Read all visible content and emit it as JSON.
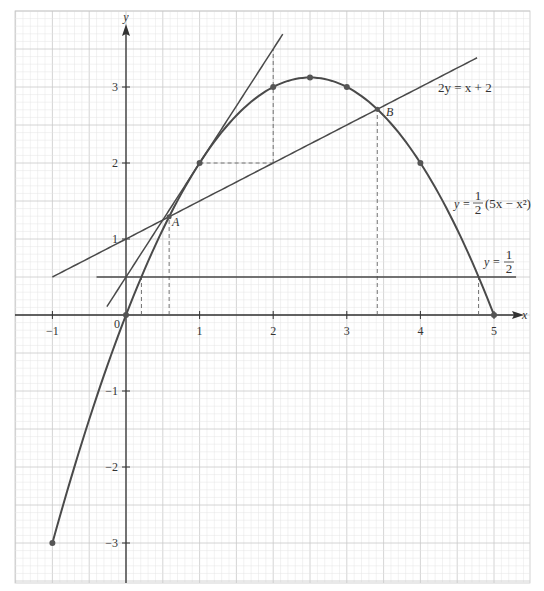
{
  "chart_data": {
    "type": "line",
    "title": "",
    "xlabel": "x",
    "ylabel": "y",
    "xlim": [
      -1,
      5
    ],
    "ylim": [
      -3.5,
      3.8
    ],
    "grid": true,
    "x_ticks": [
      -1,
      1,
      2,
      3,
      4,
      5
    ],
    "y_ticks": [
      -3,
      -2,
      -1,
      1,
      2,
      3
    ],
    "origin_label": "0",
    "series": [
      {
        "name": "parabola",
        "label": "y = ½(5x − x²)",
        "equation": "y = 0.5*(5x - x^2)",
        "x_range": [
          -1,
          5
        ],
        "points": [
          [
            -1,
            -3
          ],
          [
            0,
            0
          ],
          [
            1,
            2
          ],
          [
            2,
            3
          ],
          [
            2.5,
            3.125
          ],
          [
            3,
            3
          ],
          [
            4,
            2
          ],
          [
            5,
            0
          ]
        ]
      },
      {
        "name": "line_2y_eq_x_plus_2",
        "label": "2y = x + 2",
        "equation": "y = 0.5x + 1",
        "x_range": [
          -1,
          4.77
        ]
      },
      {
        "name": "tangent_at_x1",
        "label": "",
        "equation": "y = 1.5x + 0.5",
        "x_range": [
          -0.26,
          2.13
        ]
      },
      {
        "name": "horizontal_half",
        "label": "y = ½",
        "equation": "y = 0.5",
        "x_range": [
          -0.4,
          5.3
        ]
      }
    ],
    "annotations": [
      {
        "label": "A",
        "x": 0.586,
        "y": 1.293
      },
      {
        "label": "B",
        "x": 3.414,
        "y": 2.707
      }
    ],
    "dashed_guides": [
      {
        "from": [
          0.21,
          0
        ],
        "to": [
          0.21,
          0.5
        ]
      },
      {
        "from": [
          0.586,
          0
        ],
        "to": [
          0.586,
          1.293
        ]
      },
      {
        "from": [
          3.414,
          0
        ],
        "to": [
          3.414,
          2.707
        ]
      },
      {
        "from": [
          4.79,
          0
        ],
        "to": [
          4.79,
          0.5
        ]
      },
      {
        "from": [
          1,
          2
        ],
        "to": [
          2,
          2
        ]
      },
      {
        "from": [
          2,
          2
        ],
        "to": [
          2,
          3.5
        ]
      }
    ]
  },
  "labels": {
    "x_axis": "x",
    "y_axis": "y",
    "origin": "0",
    "line_label": "2y = x + 2",
    "parabola_label_prefix": "y = ",
    "parabola_label_suffix": "(5x − x²)",
    "half_label_prefix": "y = ",
    "frac_num": "1",
    "frac_den": "2",
    "point_a": "A",
    "point_b": "B"
  },
  "colors": {
    "curve": "#4a4a4a",
    "grid_minor": "#e4e4e4",
    "grid_major": "#c9c9c9",
    "axis": "#333333"
  }
}
